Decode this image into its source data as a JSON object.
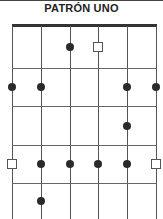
{
  "title": "PATRÓN UNO",
  "diagram": {
    "type": "guitar-scale-pattern",
    "strings": 6,
    "frets": 5,
    "string_x": [
      12,
      41,
      70,
      98,
      127,
      156
    ],
    "fret_y": [
      68,
      106,
      145,
      183
    ],
    "row_centers": [
      47,
      87,
      126,
      164,
      201
    ],
    "markers": [
      {
        "string": 3,
        "fret": 1,
        "kind": "dot"
      },
      {
        "string": 4,
        "fret": 1,
        "kind": "root"
      },
      {
        "string": 1,
        "fret": 2,
        "kind": "dot"
      },
      {
        "string": 2,
        "fret": 2,
        "kind": "dot"
      },
      {
        "string": 5,
        "fret": 2,
        "kind": "dot"
      },
      {
        "string": 6,
        "fret": 2,
        "kind": "dot"
      },
      {
        "string": 5,
        "fret": 3,
        "kind": "dot"
      },
      {
        "string": 1,
        "fret": 4,
        "kind": "root"
      },
      {
        "string": 2,
        "fret": 4,
        "kind": "dot"
      },
      {
        "string": 3,
        "fret": 4,
        "kind": "dot"
      },
      {
        "string": 4,
        "fret": 4,
        "kind": "dot"
      },
      {
        "string": 5,
        "fret": 4,
        "kind": "dot"
      },
      {
        "string": 6,
        "fret": 4,
        "kind": "root"
      },
      {
        "string": 2,
        "fret": 5,
        "kind": "dot"
      }
    ]
  }
}
